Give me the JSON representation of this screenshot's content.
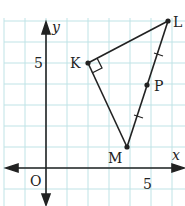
{
  "diagram": {
    "type": "coordinate-geometry",
    "axes": {
      "x_label": "x",
      "y_label": "y",
      "origin_label": "O",
      "x_tick_label": "5",
      "y_tick_label": "5"
    },
    "points": [
      {
        "name": "K",
        "x": 2,
        "y": 5
      },
      {
        "name": "L",
        "x": 6,
        "y": 7
      },
      {
        "name": "M",
        "x": 4,
        "y": 1
      },
      {
        "name": "P",
        "x": 5,
        "y": 4
      }
    ],
    "segments": [
      [
        "K",
        "L"
      ],
      [
        "K",
        "M"
      ],
      [
        "L",
        "M"
      ]
    ],
    "right_angle_at": "K",
    "congruent_marks": [
      "LP",
      "PM"
    ],
    "colors": {
      "grid": "#bfe3e6",
      "ink": "#222222"
    }
  }
}
